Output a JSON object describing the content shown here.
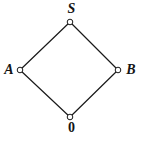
{
  "figure": {
    "type": "hasse-diagram",
    "title": "",
    "background_color": "#ffffff",
    "edge_color": "#1a1a1a",
    "node_fill_color": "#ffffff",
    "node_stroke_color": "#1a1a1a",
    "label_color": "#141414"
  },
  "nodes": [
    {
      "id": "top",
      "label": "S",
      "x": 70,
      "y": 22,
      "label_x": 70,
      "label_y": 9
    },
    {
      "id": "left",
      "label": "A",
      "x": 20,
      "y": 70,
      "label_x": 9,
      "label_y": 70
    },
    {
      "id": "right",
      "label": "B",
      "x": 118,
      "y": 70,
      "label_x": 131,
      "label_y": 70
    },
    {
      "id": "bottom",
      "label": "0",
      "x": 70,
      "y": 117,
      "label_x": 70,
      "label_y": 128
    }
  ],
  "edges": [
    {
      "from": "left",
      "to": "top"
    },
    {
      "from": "top",
      "to": "right"
    },
    {
      "from": "left",
      "to": "bottom"
    },
    {
      "from": "bottom",
      "to": "right"
    }
  ]
}
